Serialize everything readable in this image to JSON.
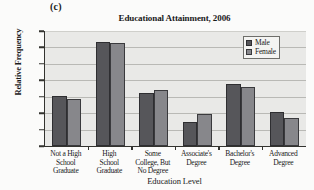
{
  "panel": {
    "label": "(c)"
  },
  "chart_data": {
    "type": "bar",
    "title": "Educational Attainment, 2006",
    "xlabel": "Education Level",
    "ylabel": "Relative Frequency",
    "categories": [
      "Not a High School Graduate",
      "High School Graduate",
      "Some College, But No Degree",
      "Associate's Degree",
      "Bachelor's Degree",
      "Advanced Degree"
    ],
    "category_lines": [
      [
        "Not a High",
        "School",
        "Graduate"
      ],
      [
        "High",
        "School",
        "Graduate"
      ],
      [
        "Some",
        "College, But",
        "No Degree"
      ],
      [
        "Associate's",
        "Degree"
      ],
      [
        "Bachelor's",
        "Degree"
      ],
      [
        "Advanced",
        "Degree"
      ]
    ],
    "series": [
      {
        "name": "Male",
        "color": "#56565a",
        "values": [
          0.151,
          0.316,
          0.16,
          0.073,
          0.188,
          0.103
        ]
      },
      {
        "name": "Female",
        "color": "#87878b",
        "values": [
          0.143,
          0.313,
          0.172,
          0.096,
          0.18,
          0.084
        ]
      }
    ],
    "ylim": [
      0.0,
      0.35
    ],
    "yticks": [
      0.0,
      0.05,
      0.1,
      0.15,
      0.2,
      0.25,
      0.3,
      0.35
    ],
    "ytick_labels": [
      "0.000",
      "0.050",
      "0.100",
      "0.150",
      "0.200",
      "0.250",
      "0.300",
      "0.350"
    ],
    "grid": true,
    "legend_position": "top-right"
  }
}
